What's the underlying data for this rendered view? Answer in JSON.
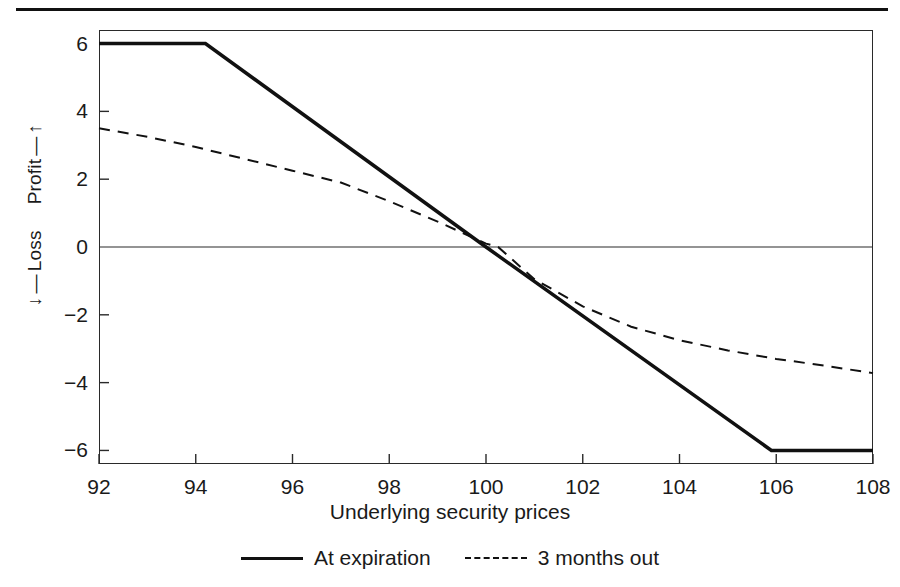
{
  "figure": {
    "axis_titles": {
      "x": "Underlying security prices",
      "y_profit": "Profit",
      "y_loss": "Loss",
      "y_profit_arrow": "↑",
      "y_loss_arrow": "↓",
      "y_profit_dash": "—",
      "y_loss_dash": "—"
    }
  },
  "chart_data": {
    "type": "line",
    "title": "",
    "subtitle": "",
    "xlabel": "Underlying security prices",
    "ylabel": "← Loss    Profit →",
    "xlim": [
      92,
      108
    ],
    "ylim": [
      -6.4,
      6.4
    ],
    "xticks": [
      92,
      94,
      96,
      98,
      100,
      102,
      104,
      106,
      108
    ],
    "xtick_labels": [
      "92",
      "94",
      "96",
      "98",
      "100",
      "102",
      "104",
      "106",
      "108"
    ],
    "yticks": [
      6,
      4,
      2,
      0,
      -2,
      -4,
      -6
    ],
    "ytick_labels": [
      "6",
      "4",
      "2",
      "0",
      "−2",
      "−4",
      "−6"
    ],
    "grid": false,
    "zero_line": true,
    "legend_position": "below",
    "series": [
      {
        "name": "At expiration",
        "style": "solid",
        "color": "#111111",
        "width": 3.5,
        "x": [
          92,
          94.2,
          100,
          105.9,
          108
        ],
        "values": [
          6,
          6,
          0,
          -6,
          -6
        ]
      },
      {
        "name": "3 months out",
        "style": "dashed",
        "color": "#111111",
        "width": 2,
        "x": [
          92,
          93,
          94,
          95,
          96,
          97,
          98,
          99,
          100,
          100.25,
          101,
          102,
          103,
          104,
          105,
          106,
          107,
          108
        ],
        "values": [
          3.5,
          3.25,
          2.95,
          2.6,
          2.25,
          1.9,
          1.35,
          0.75,
          0.1,
          0.0,
          -0.95,
          -1.75,
          -2.35,
          -2.75,
          -3.05,
          -3.3,
          -3.5,
          -3.72
        ]
      }
    ],
    "legend": [
      {
        "label": "At expiration",
        "style": "solid"
      },
      {
        "label": "3 months out",
        "style": "dashed"
      }
    ]
  }
}
